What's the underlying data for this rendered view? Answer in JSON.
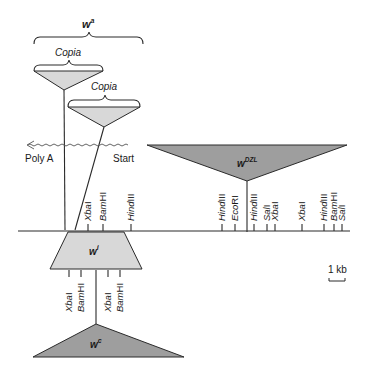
{
  "diagram": {
    "colors": {
      "insert_light": "#d8d8d8",
      "insert_dark": "#9e9e9e",
      "line": "#2a2a2a"
    },
    "alleles": {
      "wa": {
        "base": "w",
        "sup": "a"
      },
      "wDZL": {
        "base": "w",
        "sup": "DZL"
      },
      "wi": {
        "base": "w",
        "sup": "i"
      },
      "wc": {
        "base": "w",
        "sup": "c"
      }
    },
    "copia_labels": [
      "Copia",
      "Copia"
    ],
    "transcript": {
      "left_label": "Poly A",
      "right_label": "Start"
    },
    "scale_bar": {
      "label": "1 kb"
    },
    "main_map_sites": [
      {
        "name": "XbaI",
        "base": "Xba",
        "suffix": "I",
        "x": 88
      },
      {
        "name": "BamHI",
        "base": "Bam",
        "suffix": "HI",
        "x": 103
      },
      {
        "name": "HindIII",
        "base": "Hind",
        "suffix": "III",
        "x": 131
      },
      {
        "name": "HindIII",
        "base": "Hind",
        "suffix": "III",
        "x": 222
      },
      {
        "name": "EcoRI",
        "base": "Eco",
        "suffix": "RI",
        "x": 235
      },
      {
        "name": "HindIII",
        "base": "Hind",
        "suffix": "III",
        "x": 254
      },
      {
        "name": "SalI",
        "base": "Sal",
        "suffix": "I",
        "x": 267
      },
      {
        "name": "XbaI",
        "base": "Xba",
        "suffix": "I",
        "x": 275
      },
      {
        "name": "XbaI",
        "base": "Xba",
        "suffix": "I",
        "x": 302
      },
      {
        "name": "HindIII",
        "base": "Hind",
        "suffix": "III",
        "x": 324
      },
      {
        "name": "BamHI",
        "base": "Bam",
        "suffix": "HI",
        "x": 334
      },
      {
        "name": "SalI",
        "base": "Sal",
        "suffix": "I",
        "x": 342
      }
    ],
    "wi_sites": [
      {
        "name": "XbaI",
        "base": "Xba",
        "suffix": "I",
        "x": 69
      },
      {
        "name": "BamHI",
        "base": "Bam",
        "suffix": "HI",
        "x": 81
      },
      {
        "name": "XbaI",
        "base": "Xba",
        "suffix": "I",
        "x": 108
      },
      {
        "name": "BamHI",
        "base": "Bam",
        "suffix": "HI",
        "x": 120
      }
    ]
  }
}
